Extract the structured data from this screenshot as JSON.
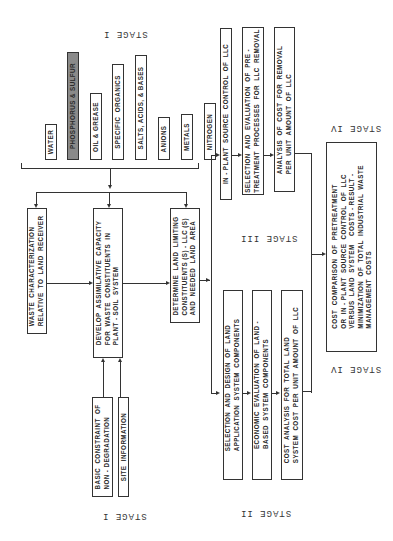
{
  "stage_labels": {
    "stage1_top": "STAGE I",
    "stage1_bottom": "STAGE I",
    "stage2": "STAGE II",
    "stage3": "STAGE III",
    "stage4_top": "STAGE IV",
    "stage4_bottom": "STAGE IV"
  },
  "constituents": [
    {
      "label": "WATER",
      "highlighted": false
    },
    {
      "label": "PHOSPHORUS & SULFUR",
      "highlighted": true
    },
    {
      "label": "OIL & GREASE",
      "highlighted": false
    },
    {
      "label": "SPECIFIC  ORGANICS",
      "highlighted": false
    },
    {
      "label": "SALTS, ACIDS, & BASES",
      "highlighted": false
    },
    {
      "label": "ANIONS",
      "highlighted": false
    },
    {
      "label": "METALS",
      "highlighted": false
    },
    {
      "label": "NITROGEN",
      "highlighted": false
    }
  ],
  "stage1": {
    "waste_characterization": "WASTE  CHARACTERIZATION\nRELATIVE  TO  LAND  RECEIVER",
    "develop_capacity": "DEVELOP  ASSIMILATIVE  CAPACITY\nFOR  WASTE  CONSTITUENTS  IN\nPLANT - SOIL  SYSTEM",
    "determine_llc": "DETERMINE  LAND  LIMITING\nCONSTITUENTS (S) - LLC (S)\nAND  NEEDED  LAND  AREA",
    "basic_constraint": "BASIC  CONSTRAINT  OF\nNON - DEGRADATION",
    "site_information": "SITE  INFORMATION"
  },
  "stage2": {
    "selection_design": "SELECTION  AND  DESIGN  OF  LAND\nAPPLICATION  SYSTEM  COMPONENTS",
    "economic_evaluation": "ECONOMIC  EVALUATION  OF  LAND -\nBASED  SYSTEM  COMPONENTS",
    "cost_analysis": "COST  ANALYSIS  FOR  TOTAL  LAND\nSYSTEM  COST  PER  UNIT  AMOUNT  OF  LLC"
  },
  "stage3": {
    "in_plant_control": "IN - PLANT  SOURCE  CONTROL  OF  LLC",
    "selection_evaluation": "SELECTION  AND  EVALUATION  OF  PRE -\nTREATMENT  PROCESSES  FOR  LLC  REMOVAL",
    "analysis_cost": "ANALYSIS  OF  COST  FOR  REMOVAL\nPER  UNIT  AMOUNT  OF  LLC"
  },
  "stage4": {
    "cost_comparison": "COST  COMPARISON  OF  PRETREATMENT\nOR  IN - PLANT  SOURCE  CONTROL  OF  LLC\nVERSUS  LAND  SYSTEM    COSTS - RESULT -\nMINIMIZATION  OF  TOTAL  INDUSTRIAL  WASTE\nMANAGEMENT  COSTS"
  }
}
